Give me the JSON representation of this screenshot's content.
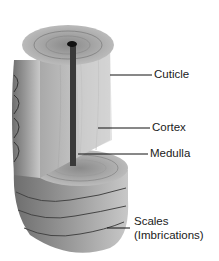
{
  "diagram": {
    "labels": [
      {
        "id": "cuticle",
        "text": "Cuticle"
      },
      {
        "id": "cortex",
        "text": "Cortex"
      },
      {
        "id": "medulla",
        "text": "Medulla"
      },
      {
        "id": "scales",
        "text": "Scales",
        "text2": "(Imbrications)"
      }
    ]
  }
}
